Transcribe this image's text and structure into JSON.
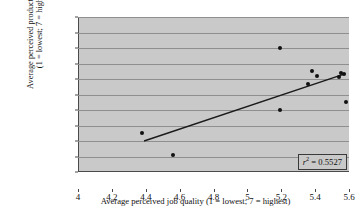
{
  "figure": {
    "panel_label": "(b)",
    "background_color": "#c9c9c9",
    "grid_color": "#8f8f8f",
    "axis_color": "#4a4a4a",
    "point_color": "#111111",
    "line_color": "#1a1a1a"
  },
  "chart_data": {
    "type": "scatter",
    "title": "",
    "xlabel": "Average perceived job quality (1 = lowest; 7 = highest)",
    "ylabel_line1": "Average perceived productivity level",
    "ylabel_line2": "(1 = lowest; 7 = highest)",
    "xlim": [
      4,
      5.6
    ],
    "ylim": [
      5,
      6
    ],
    "xticks": [
      4,
      4.2,
      4.4,
      4.6,
      4.8,
      5,
      5.2,
      5.4,
      5.6
    ],
    "xtick_labels": [
      "4",
      "4.2",
      "4.4",
      "4.6",
      "4.8",
      "5",
      "5.2",
      "5.4",
      "5.6"
    ],
    "yticks": [
      5,
      5.1,
      5.2,
      5.3,
      5.4,
      5.5,
      5.6,
      5.7,
      5.8,
      5.9,
      6
    ],
    "ytick_labels": [
      "5",
      "5.1",
      "5.2",
      "5.3",
      "5.4",
      "5.5",
      "5.6",
      "5.7",
      "5.8",
      "5.9",
      "6"
    ],
    "grid": "horizontal",
    "legend": "none",
    "points": [
      {
        "x": 4.38,
        "y": 5.25
      },
      {
        "x": 4.56,
        "y": 5.11
      },
      {
        "x": 5.19,
        "y": 5.8
      },
      {
        "x": 5.19,
        "y": 5.4
      },
      {
        "x": 5.38,
        "y": 5.65
      },
      {
        "x": 5.41,
        "y": 5.62
      },
      {
        "x": 5.36,
        "y": 5.57
      },
      {
        "x": 5.55,
        "y": 5.64
      },
      {
        "x": 5.57,
        "y": 5.63
      },
      {
        "x": 5.54,
        "y": 5.61
      },
      {
        "x": 5.58,
        "y": 5.45
      }
    ],
    "trendline": {
      "x1": 4.39,
      "y1": 5.2,
      "x2": 5.58,
      "y2": 5.635
    },
    "annotation": {
      "label_r": "r",
      "label_sup": "2",
      "label_eq": " = 0.5527",
      "full": "r2 = 0.5527"
    }
  }
}
